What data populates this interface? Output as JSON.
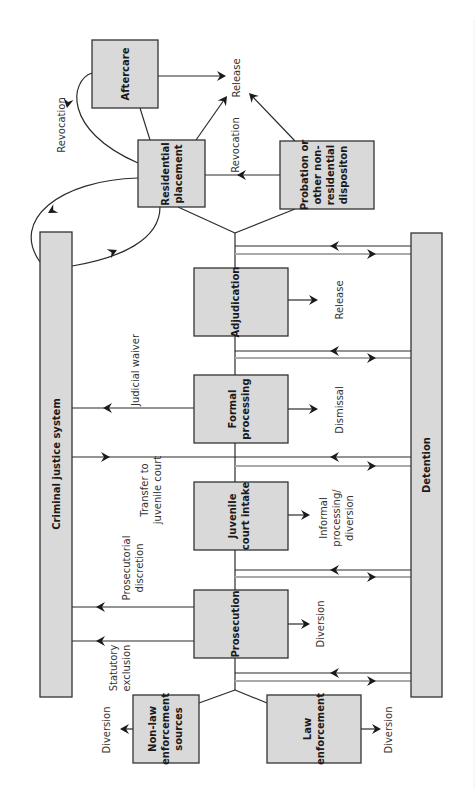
{
  "diagram": {
    "orientation": "rotated-90-ccw",
    "colors": {
      "box_fill": "#d9d9d9",
      "line": "#2b2b2b",
      "return_line": "#a9a9a9"
    },
    "nodes": {
      "criminal_justice_system": "Criminal justice system",
      "detention": "Detention",
      "aftercare": "Aftercare",
      "residential_placement": [
        "Residential",
        "placement"
      ],
      "probation": [
        "Probation or",
        "other non-",
        "residential",
        "dispositon"
      ],
      "adjudication": "Adjudication",
      "formal_processing": [
        "Formal",
        "processing"
      ],
      "juvenile_court_intake": [
        "Juvenile",
        "court intake"
      ],
      "prosecution": "Prosecution",
      "non_law_enforcement": [
        "Non-law",
        "enforcement",
        "sources"
      ],
      "law_enforcement": [
        "Law",
        "enforcement"
      ]
    },
    "labels": {
      "release_top": "Release",
      "revocation_left": "Revocation",
      "revocation_mid": "Revocation",
      "judicial_waiver": "Judicial waiver",
      "transfer": [
        "Transfer to",
        "juvenile court"
      ],
      "prosecutorial": [
        "Prosecutorial",
        "discretion"
      ],
      "statutory": [
        "Statutory",
        "exclusion"
      ],
      "release_adj": "Release",
      "dismissal": "Dismissal",
      "informal": [
        "Informal",
        "processing/",
        "diversion"
      ],
      "diversion_pros": "Diversion",
      "diversion_nonlaw": "Diversion",
      "diversion_law": "Diversion"
    }
  }
}
